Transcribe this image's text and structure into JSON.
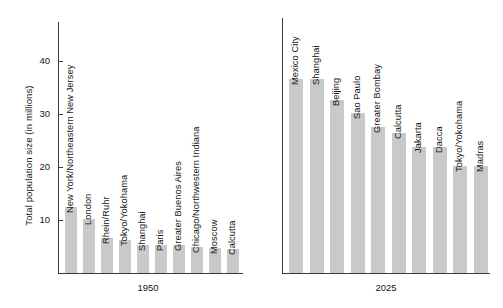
{
  "chart_data": {
    "type": "bar",
    "title": "",
    "xlabel": "",
    "ylabel": "Total population size (in millions)",
    "ylim": [
      0,
      45
    ],
    "yticks": [
      10,
      20,
      30,
      40
    ],
    "ytick_labels": [
      "10",
      "20",
      "30",
      "40"
    ],
    "grid": false,
    "legend": "none",
    "panels": [
      {
        "caption": "1950",
        "categories": [
          "New York/Northeastern New Jersey",
          "London",
          "Rhein/Ruhr",
          "Tokyo/Yokohama",
          "Shanghai",
          "Paris",
          "Greater Buenos Aires",
          "Chicago/Northwestern Indiana",
          "Moscow",
          "Calcutta"
        ],
        "values": [
          12.4,
          10.2,
          6.6,
          6.3,
          5.3,
          5.3,
          5.3,
          4.9,
          4.8,
          4.6
        ]
      },
      {
        "caption": "2025",
        "categories": [
          "Mexico City",
          "Shanghai",
          "Beijing",
          "Sao Paulo",
          "Greater Bombay",
          "Calcutta",
          "Jakarta",
          "Dacca",
          "Tokyo/Yokohama",
          "Madras"
        ],
        "values": [
          36.6,
          36.5,
          32.6,
          30.2,
          27.5,
          26.3,
          23.8,
          23.7,
          20.2,
          20.1
        ]
      }
    ]
  },
  "colors": {
    "bar_fill": "#c9c9c9",
    "axis": "#3a3a3a",
    "text": "#161616",
    "background": "#ffffff"
  }
}
